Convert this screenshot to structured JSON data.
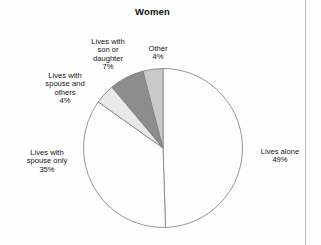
{
  "chart_data": {
    "type": "pie",
    "title": "Women",
    "categories": [
      "Lives alone",
      "Lives with spouse only",
      "Lives with spouse and others",
      "Lives with son or daughter",
      "Other"
    ],
    "values": [
      49,
      35,
      4,
      7,
      4
    ],
    "value_suffix": "%",
    "slice_colors": [
      "#fdfdfd",
      "#fdfdfd",
      "#e9e9e9",
      "#8d8d8d",
      "#c9c9c9"
    ],
    "stroke_color": "#7d7d7d",
    "start_angle_deg": 0,
    "direction": "clockwise",
    "legend": "none",
    "grid": false,
    "labels": [
      {
        "name": "Lives alone",
        "text": "Lives alone",
        "pct": "49%"
      },
      {
        "name": "Lives with spouse only",
        "text": "Lives with\nspouse only",
        "pct": "35%"
      },
      {
        "name": "Lives with spouse and others",
        "text": "Lives with\nspouse and\nothers",
        "pct": "4%"
      },
      {
        "name": "Lives with son or daughter",
        "text": "Lives with\nson or\ndaughter",
        "pct": "7%"
      },
      {
        "name": "Other",
        "text": "Other",
        "pct": "4%"
      }
    ]
  },
  "chart": {
    "title": "Women"
  },
  "labels": {
    "alone": {
      "text": "Lives alone",
      "pct": "49%"
    },
    "spouse_only": {
      "text": "Lives with\nspouse only",
      "pct": "35%"
    },
    "spouse_others": {
      "text": "Lives with\nspouse and\nothers",
      "pct": "4%"
    },
    "son_daughter": {
      "text": "Lives with\nson or\ndaughter",
      "pct": "7%"
    },
    "other": {
      "text": "Other",
      "pct": "4%"
    }
  }
}
